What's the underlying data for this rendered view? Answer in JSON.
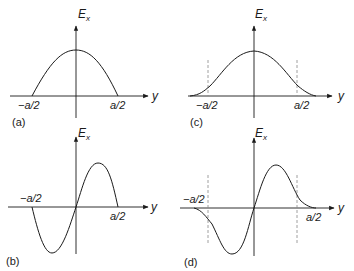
{
  "figure": {
    "axis_labels": {
      "vertical": "E",
      "vertical_sub": "x",
      "horizontal": "y"
    },
    "tick_labels": {
      "neg": "−a/2",
      "pos": "a/2"
    },
    "panels": [
      {
        "id": "a",
        "label": "(a)",
        "description": "Half-cosine field profile confined within −a/2 to a/2"
      },
      {
        "id": "b",
        "label": "(b)",
        "description": "Full-sine (antisymmetric) field profile within −a/2 to a/2"
      },
      {
        "id": "c",
        "label": "(c)",
        "description": "Symmetric profile with evanescent tails extending beyond dashed boundaries at ±a/2"
      },
      {
        "id": "d",
        "label": "(d)",
        "description": "Antisymmetric profile with evanescent tails extending beyond dashed boundaries at ±a/2"
      }
    ],
    "colors": {
      "line": "#1a1a1a",
      "dashed": "#888888",
      "background": "#ffffff"
    }
  }
}
